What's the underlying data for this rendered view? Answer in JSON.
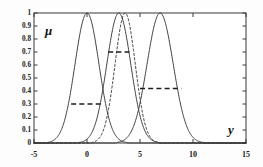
{
  "chart_data": {
    "type": "line",
    "title": "",
    "xlabel": "y",
    "ylabel": "μ",
    "xlim": [
      -5,
      15
    ],
    "ylim": [
      0,
      1
    ],
    "grid": false,
    "legend": "none",
    "x_ticks": [
      -5,
      0,
      5,
      10,
      15
    ],
    "x_tick_labels": [
      "-5",
      "0",
      "5",
      "10",
      "15"
    ],
    "y_ticks": [
      0,
      0.1,
      0.2,
      0.3,
      0.4,
      0.5,
      0.6,
      0.7,
      0.8,
      0.9,
      1
    ],
    "y_tick_labels": [
      "0",
      "0.1",
      "0.2",
      "0.3",
      "0.4",
      "0.5",
      "0.6",
      "0.7",
      "0.8",
      "0.9",
      "1"
    ],
    "series": [
      {
        "name": "gaussian-1",
        "style": "solid",
        "center": 0.0,
        "width": 1.6,
        "peak": 1.0,
        "color": "#3a3a3a"
      },
      {
        "name": "gaussian-2",
        "style": "solid",
        "center": 3.0,
        "width": 1.6,
        "peak": 1.0,
        "color": "#3a3a3a"
      },
      {
        "name": "gaussian-3",
        "style": "solid",
        "center": 6.9,
        "width": 1.75,
        "peak": 1.0,
        "color": "#3a3a3a"
      },
      {
        "name": "gaussian-dashed",
        "style": "dashed",
        "center": 3.6,
        "width": 1.35,
        "peak": 1.0,
        "color": "#3a3a3a"
      }
    ],
    "alpha_cuts": [
      {
        "name": "alpha-cut-low",
        "level": 0.3,
        "x_start": -1.5,
        "x_end": 1.5
      },
      {
        "name": "alpha-cut-high",
        "level": 0.7,
        "x_start": 2.0,
        "x_end": 4.0
      },
      {
        "name": "alpha-cut-mid",
        "level": 0.42,
        "x_start": 5.0,
        "x_end": 8.9
      }
    ]
  },
  "axes": {
    "y_axis_symbol": "μ",
    "x_axis_symbol": "y"
  }
}
